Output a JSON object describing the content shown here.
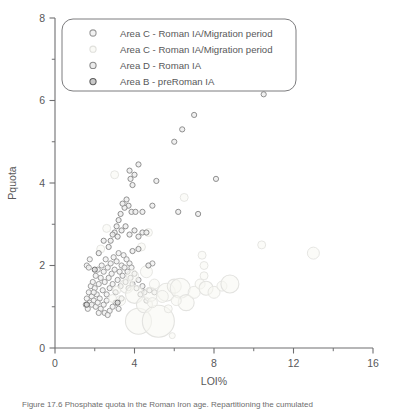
{
  "chart_data": {
    "type": "scatter",
    "title": "",
    "xlabel": "LOI%",
    "ylabel": "Pquota",
    "xlim": [
      0,
      16
    ],
    "ylim": [
      0,
      8
    ],
    "xticks": [
      0,
      4,
      8,
      12,
      16
    ],
    "xminorticks": [
      2,
      6,
      10,
      14
    ],
    "yticks": [
      0,
      2,
      4,
      6,
      8
    ],
    "yminorticks": [
      1,
      3,
      5,
      7
    ],
    "grid": false,
    "legend_position": "top-left-inside",
    "marker_style": "open-circle",
    "series": [
      {
        "name": "Area C - Roman IA/Migration period",
        "color": "#9a9a9a",
        "marker_fill": "#f2f2f2",
        "points": [
          [
            1.55,
            1.05
          ],
          [
            1.6,
            1.2
          ],
          [
            1.65,
            0.95
          ],
          [
            1.7,
            1.35
          ],
          [
            1.75,
            1.1
          ],
          [
            1.8,
            1.5
          ],
          [
            1.85,
            1.25
          ],
          [
            1.9,
            1.6
          ],
          [
            1.95,
            1.15
          ],
          [
            2.0,
            1.45
          ],
          [
            2.05,
            1.75
          ],
          [
            2.1,
            1.3
          ],
          [
            2.15,
            1.9
          ],
          [
            2.2,
            1.55
          ],
          [
            2.25,
            1.2
          ],
          [
            2.3,
            1.7
          ],
          [
            2.35,
            2.0
          ],
          [
            2.4,
            1.4
          ],
          [
            2.45,
            1.85
          ],
          [
            2.5,
            1.6
          ],
          [
            2.55,
            2.15
          ],
          [
            2.6,
            1.3
          ],
          [
            2.65,
            1.95
          ],
          [
            2.7,
            1.7
          ],
          [
            2.75,
            1.45
          ],
          [
            2.8,
            2.05
          ],
          [
            2.85,
            1.8
          ],
          [
            2.9,
            1.55
          ],
          [
            2.95,
            2.2
          ],
          [
            3.0,
            1.9
          ],
          [
            3.05,
            1.35
          ],
          [
            3.1,
            2.1
          ],
          [
            3.15,
            1.65
          ],
          [
            3.2,
            2.3
          ],
          [
            3.25,
            1.85
          ],
          [
            3.3,
            1.5
          ],
          [
            3.35,
            2.0
          ],
          [
            3.4,
            1.75
          ],
          [
            3.45,
            2.25
          ],
          [
            3.5,
            1.95
          ],
          [
            3.55,
            1.6
          ],
          [
            3.6,
            2.15
          ],
          [
            3.65,
            1.85
          ],
          [
            3.7,
            1.45
          ],
          [
            3.75,
            2.05
          ],
          [
            3.8,
            1.7
          ],
          [
            3.85,
            1.95
          ],
          [
            3.9,
            1.55
          ],
          [
            4.0,
            1.8
          ],
          [
            4.1,
            1.45
          ],
          [
            4.2,
            1.65
          ],
          [
            4.3,
            1.3
          ],
          [
            4.4,
            1.5
          ],
          [
            4.5,
            1.35
          ],
          [
            4.6,
            1.15
          ],
          [
            4.75,
            1.4
          ],
          [
            4.9,
            2.05
          ],
          [
            5.0,
            1.35
          ],
          [
            1.6,
            2.0
          ],
          [
            1.7,
            1.95
          ],
          [
            1.75,
            2.15
          ],
          [
            1.85,
            1.05
          ],
          [
            1.95,
            1.35
          ],
          [
            2.05,
            1.0
          ],
          [
            2.15,
            1.1
          ],
          [
            2.3,
            0.95
          ],
          [
            2.45,
            1.05
          ],
          [
            2.6,
            1.15
          ],
          [
            2.75,
            0.9
          ],
          [
            2.9,
            1.0
          ],
          [
            3.05,
            1.1
          ],
          [
            3.2,
            0.95
          ],
          [
            3.35,
            1.2
          ],
          [
            2.5,
            0.85
          ],
          [
            2.65,
            0.8
          ],
          [
            2.2,
            0.85
          ]
        ]
      },
      {
        "name": "Area C - Roman IA/Migration period",
        "color": "#e3e3e0",
        "marker_fill": "#f7f7f3",
        "bubble": true,
        "points": [
          [
            3.6,
            1.5,
            7
          ],
          [
            4.0,
            1.3,
            9
          ],
          [
            4.2,
            0.65,
            13
          ],
          [
            4.5,
            1.05,
            8
          ],
          [
            4.8,
            1.3,
            7
          ],
          [
            5.2,
            0.65,
            16
          ],
          [
            5.6,
            1.35,
            9
          ],
          [
            6.0,
            1.5,
            7
          ],
          [
            6.3,
            1.45,
            10
          ],
          [
            6.6,
            1.1,
            8
          ],
          [
            7.0,
            1.35,
            6
          ],
          [
            7.3,
            1.55,
            5
          ],
          [
            7.6,
            1.45,
            7
          ],
          [
            8.0,
            1.35,
            6
          ],
          [
            8.4,
            1.5,
            5
          ],
          [
            8.8,
            1.55,
            9
          ],
          [
            3.3,
            1.15,
            5
          ],
          [
            3.9,
            1.75,
            6
          ],
          [
            4.6,
            1.85,
            6
          ],
          [
            5.0,
            1.55,
            5
          ],
          [
            5.4,
            1.25,
            6
          ],
          [
            2.9,
            1.2,
            4
          ],
          [
            3.1,
            1.4,
            4
          ],
          [
            7.5,
            1.75,
            4
          ],
          [
            7.5,
            2.0,
            4
          ],
          [
            7.4,
            2.25,
            4
          ],
          [
            6.5,
            3.65,
            4
          ],
          [
            10.4,
            2.5,
            4
          ],
          [
            13.0,
            2.3,
            6
          ],
          [
            4.7,
            2.8,
            4
          ],
          [
            4.35,
            2.45,
            4
          ],
          [
            2.3,
            2.4,
            4
          ],
          [
            2.6,
            2.9,
            4
          ],
          [
            3.0,
            4.2,
            4
          ],
          [
            5.9,
            0.3,
            3
          ],
          [
            4.9,
            1.1,
            5
          ],
          [
            6.1,
            1.15,
            5
          ],
          [
            5.7,
            0.95,
            4
          ]
        ]
      },
      {
        "name": "Area D - Roman IA",
        "color": "#8a8a8a",
        "marker_fill": "#ededed",
        "points": [
          [
            4.0,
            4.2
          ],
          [
            4.2,
            4.45
          ],
          [
            3.75,
            4.3
          ],
          [
            3.8,
            4.1
          ],
          [
            3.9,
            3.95
          ],
          [
            3.6,
            3.6
          ],
          [
            3.7,
            3.45
          ],
          [
            3.85,
            3.3
          ],
          [
            4.05,
            3.3
          ],
          [
            4.4,
            3.3
          ],
          [
            3.5,
            3.4
          ],
          [
            3.4,
            3.5
          ],
          [
            3.3,
            3.25
          ],
          [
            3.2,
            3.1
          ],
          [
            3.1,
            2.95
          ],
          [
            3.0,
            2.8
          ],
          [
            2.9,
            2.75
          ],
          [
            2.8,
            2.6
          ],
          [
            2.7,
            2.45
          ],
          [
            3.15,
            2.7
          ],
          [
            3.35,
            2.85
          ],
          [
            3.55,
            2.95
          ],
          [
            3.75,
            2.75
          ],
          [
            4.0,
            2.85
          ],
          [
            4.2,
            2.7
          ],
          [
            4.4,
            2.8
          ],
          [
            4.6,
            2.8
          ],
          [
            5.1,
            4.05
          ],
          [
            4.9,
            3.45
          ],
          [
            6.0,
            5.0
          ],
          [
            6.4,
            5.3
          ],
          [
            7.0,
            5.65
          ],
          [
            6.2,
            3.3
          ],
          [
            7.2,
            3.25
          ],
          [
            8.1,
            4.1
          ],
          [
            10.5,
            6.15
          ],
          [
            4.7,
            2.0
          ],
          [
            4.2,
            2.4
          ],
          [
            3.9,
            2.35
          ],
          [
            2.45,
            2.6
          ],
          [
            2.2,
            2.3
          ]
        ]
      },
      {
        "name": "Area B - preRoman IA",
        "color": "#6a6a6a",
        "marker_fill": "#d8d8d8",
        "points": [
          [
            3.15,
            1.1
          ],
          [
            1.6,
            1.05
          ],
          [
            2.0,
            1.9
          ]
        ]
      }
    ]
  },
  "legend": {
    "entries": [
      {
        "label": "Area C - Roman IA/Migration period",
        "stroke": "#9a9a9a",
        "fill": "#f2f2f2"
      },
      {
        "label": "Area C - Roman IA/Migration period",
        "stroke": "#e0e0dc",
        "fill": "#fafaf6"
      },
      {
        "label": "Area D - Roman IA",
        "stroke": "#8a8a8a",
        "fill": "#ebebeb"
      },
      {
        "label": "Area B - preRoman IA",
        "stroke": "#5f5f5f",
        "fill": "#c9c9c9"
      }
    ]
  },
  "axes": {
    "x_title": "LOI%",
    "y_title": "Pquota",
    "x_tick_labels": [
      "0",
      "4",
      "8",
      "12",
      "16"
    ],
    "y_tick_labels": [
      "0",
      "2",
      "4",
      "6",
      "8"
    ],
    "axis_color": "#6f6f71"
  },
  "caption": {
    "text": "Figure 17.6    Phosphate quota in the Roman Iron age. Repartitioning the cumulated"
  }
}
